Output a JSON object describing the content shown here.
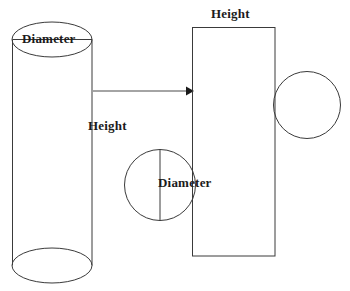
{
  "diagram": {
    "background_color": "#ffffff",
    "stroke_color": "#3a3a3a",
    "text_color": "#1b1b1b",
    "labels": {
      "cylinder_diameter": "Diameter",
      "cylinder_height": "Height",
      "rectangle_height": "Height",
      "circle_diameter": "Diameter"
    },
    "shapes": {
      "cylinder": {
        "name": "cylinder",
        "top_ellipse": {
          "cx": 52,
          "cy": 39.5,
          "rx": 40,
          "ry": 17.5
        },
        "bottom_ellipse": {
          "cx": 52,
          "cy": 265.5,
          "rx": 40,
          "ry": 17.5
        },
        "left_side": {
          "x": 12,
          "y1": 39.5,
          "y2": 265.5
        },
        "right_side": {
          "x": 92,
          "y1": 39.5,
          "y2": 265.5
        },
        "diameter_line": {
          "x1": 12,
          "x2": 92,
          "y": 39.5
        }
      },
      "arrow": {
        "name": "transform-arrow",
        "x1": 92,
        "y1": 91,
        "x2": 193,
        "y2": 91,
        "direction": "right"
      },
      "rectangle": {
        "name": "lateral-surface-rectangle",
        "x": 192,
        "y": 27,
        "width": 83,
        "height": 229
      },
      "circle_top": {
        "name": "top-base-circle",
        "cx": 307,
        "cy": 105,
        "r": 33.5
      },
      "circle_bottom": {
        "name": "bottom-base-circle",
        "cx": 160,
        "cy": 185,
        "r": 35.5,
        "diameter_line": {
          "x": 160,
          "y1": 149.5,
          "y2": 220.5
        }
      }
    }
  }
}
